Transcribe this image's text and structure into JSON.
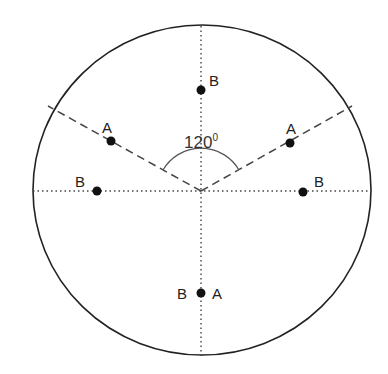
{
  "diagram": {
    "center": {
      "x": 201,
      "y": 191
    },
    "circle": {
      "cx": 202,
      "cy": 190,
      "rx": 169,
      "ry": 165,
      "stroke": "#222222"
    },
    "angle": {
      "value": "120",
      "unit": "0",
      "label": "1200"
    },
    "lines": {
      "vertical": {
        "x1": 201,
        "y1": 26,
        "x2": 201,
        "y2": 356,
        "style": "dotted"
      },
      "horizontal": {
        "x1": 33,
        "y1": 191,
        "x2": 371,
        "y2": 191,
        "style": "dotted"
      },
      "dashed_left": {
        "x1": 201,
        "y1": 191,
        "x2": 48,
        "y2": 106,
        "style": "dashed"
      },
      "dashed_right": {
        "x1": 201,
        "y1": 191,
        "x2": 352,
        "y2": 106,
        "style": "dashed"
      }
    },
    "points": [
      {
        "id": "top-b",
        "x": 201,
        "y": 90,
        "labels": [
          {
            "text": "B",
            "x": 209,
            "y": 86
          }
        ]
      },
      {
        "id": "left-a",
        "x": 111,
        "y": 141,
        "labels": [
          {
            "text": "A",
            "x": 102,
            "y": 132
          }
        ]
      },
      {
        "id": "right-a",
        "x": 290,
        "y": 143,
        "labels": [
          {
            "text": "A",
            "x": 287,
            "y": 134
          }
        ]
      },
      {
        "id": "left-b",
        "x": 97,
        "y": 191,
        "labels": [
          {
            "text": "B",
            "x": 75,
            "y": 186
          }
        ]
      },
      {
        "id": "right-b",
        "x": 303,
        "y": 192,
        "labels": [
          {
            "text": "B",
            "x": 314,
            "y": 186
          }
        ]
      },
      {
        "id": "bottom-ab",
        "x": 201,
        "y": 293,
        "labels": [
          {
            "text": "B",
            "x": 177,
            "y": 299
          },
          {
            "text": "A",
            "x": 212,
            "y": 299
          }
        ]
      }
    ],
    "label_text": {
      "top_b": "B",
      "left_a": "A",
      "right_a": "A",
      "left_b": "B",
      "right_b": "B",
      "bottom_b": "B",
      "bottom_a": "A",
      "angle_number": "120",
      "angle_degree": "0"
    }
  }
}
